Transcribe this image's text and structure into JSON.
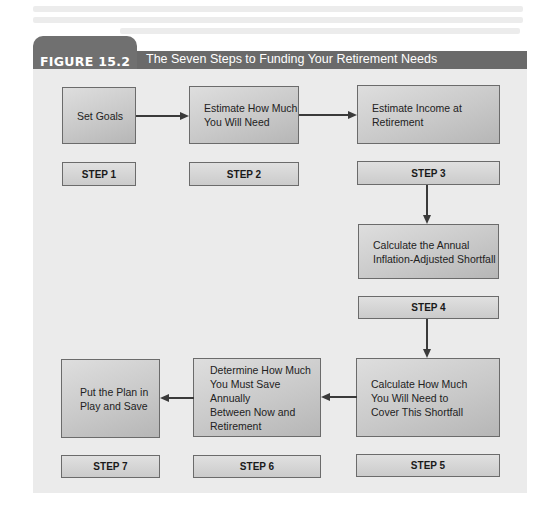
{
  "figure": {
    "label": "FIGURE 15.2",
    "title": "The Seven Steps to Funding Your Retirement Needs"
  },
  "steps": [
    {
      "step_label": "STEP 1",
      "text": "Set Goals"
    },
    {
      "step_label": "STEP 2",
      "text": "Estimate How Much\nYou Will Need"
    },
    {
      "step_label": "STEP 3",
      "text": "Estimate Income at\nRetirement"
    },
    {
      "step_label": "STEP 4",
      "text": "Calculate the Annual\nInflation-Adjusted Shortfall"
    },
    {
      "step_label": "STEP 5",
      "text": "Calculate How Much\nYou Will Need to\nCover This Shortfall"
    },
    {
      "step_label": "STEP 6",
      "text": "Determine How Much\nYou Must Save Annually\nBetween Now and\nRetirement"
    },
    {
      "step_label": "STEP 7",
      "text": "Put the Plan in\nPlay and Save"
    }
  ],
  "flow": [
    "STEP 1",
    "STEP 2",
    "STEP 3",
    "STEP 4",
    "STEP 5",
    "STEP 6",
    "STEP 7"
  ],
  "colors": {
    "header": "#6a6a6a",
    "panel": "#ebebeb",
    "box_border": "#6b6b6b",
    "arrow": "#3a3a3a"
  }
}
